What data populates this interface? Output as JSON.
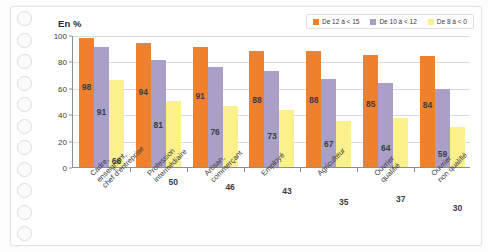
{
  "page": {
    "media": "spiral-bound-notebook-page",
    "ring_hole_count": 11
  },
  "chart_data": {
    "type": "bar",
    "title": "En %",
    "xlabel": "",
    "ylabel": "En %",
    "ylim": [
      0,
      100
    ],
    "yticks": [
      0,
      20,
      40,
      60,
      80,
      100
    ],
    "grid": true,
    "legend_position": "top-right",
    "categories": [
      "Cadre,\nenseignant,\nchef d'entreprise",
      "Profession\nintermédiaire",
      "Artisan,\ncommerçant",
      "Employé",
      "Agriculteur",
      "Ouvrier\nqualifié",
      "Ouvrier\nnon qualifié"
    ],
    "series": [
      {
        "name": "De 12 à < 15",
        "color": "#F0812C",
        "values": [
          98,
          94,
          91,
          88,
          88,
          85,
          84
        ]
      },
      {
        "name": "De 10 à < 12",
        "color": "#A9A0C8",
        "values": [
          91,
          81,
          76,
          73,
          67,
          64,
          59
        ]
      },
      {
        "name": "De 8 à < 0",
        "color": "#FAF08C",
        "values": [
          66,
          50,
          46,
          43,
          35,
          37,
          30
        ]
      }
    ]
  }
}
